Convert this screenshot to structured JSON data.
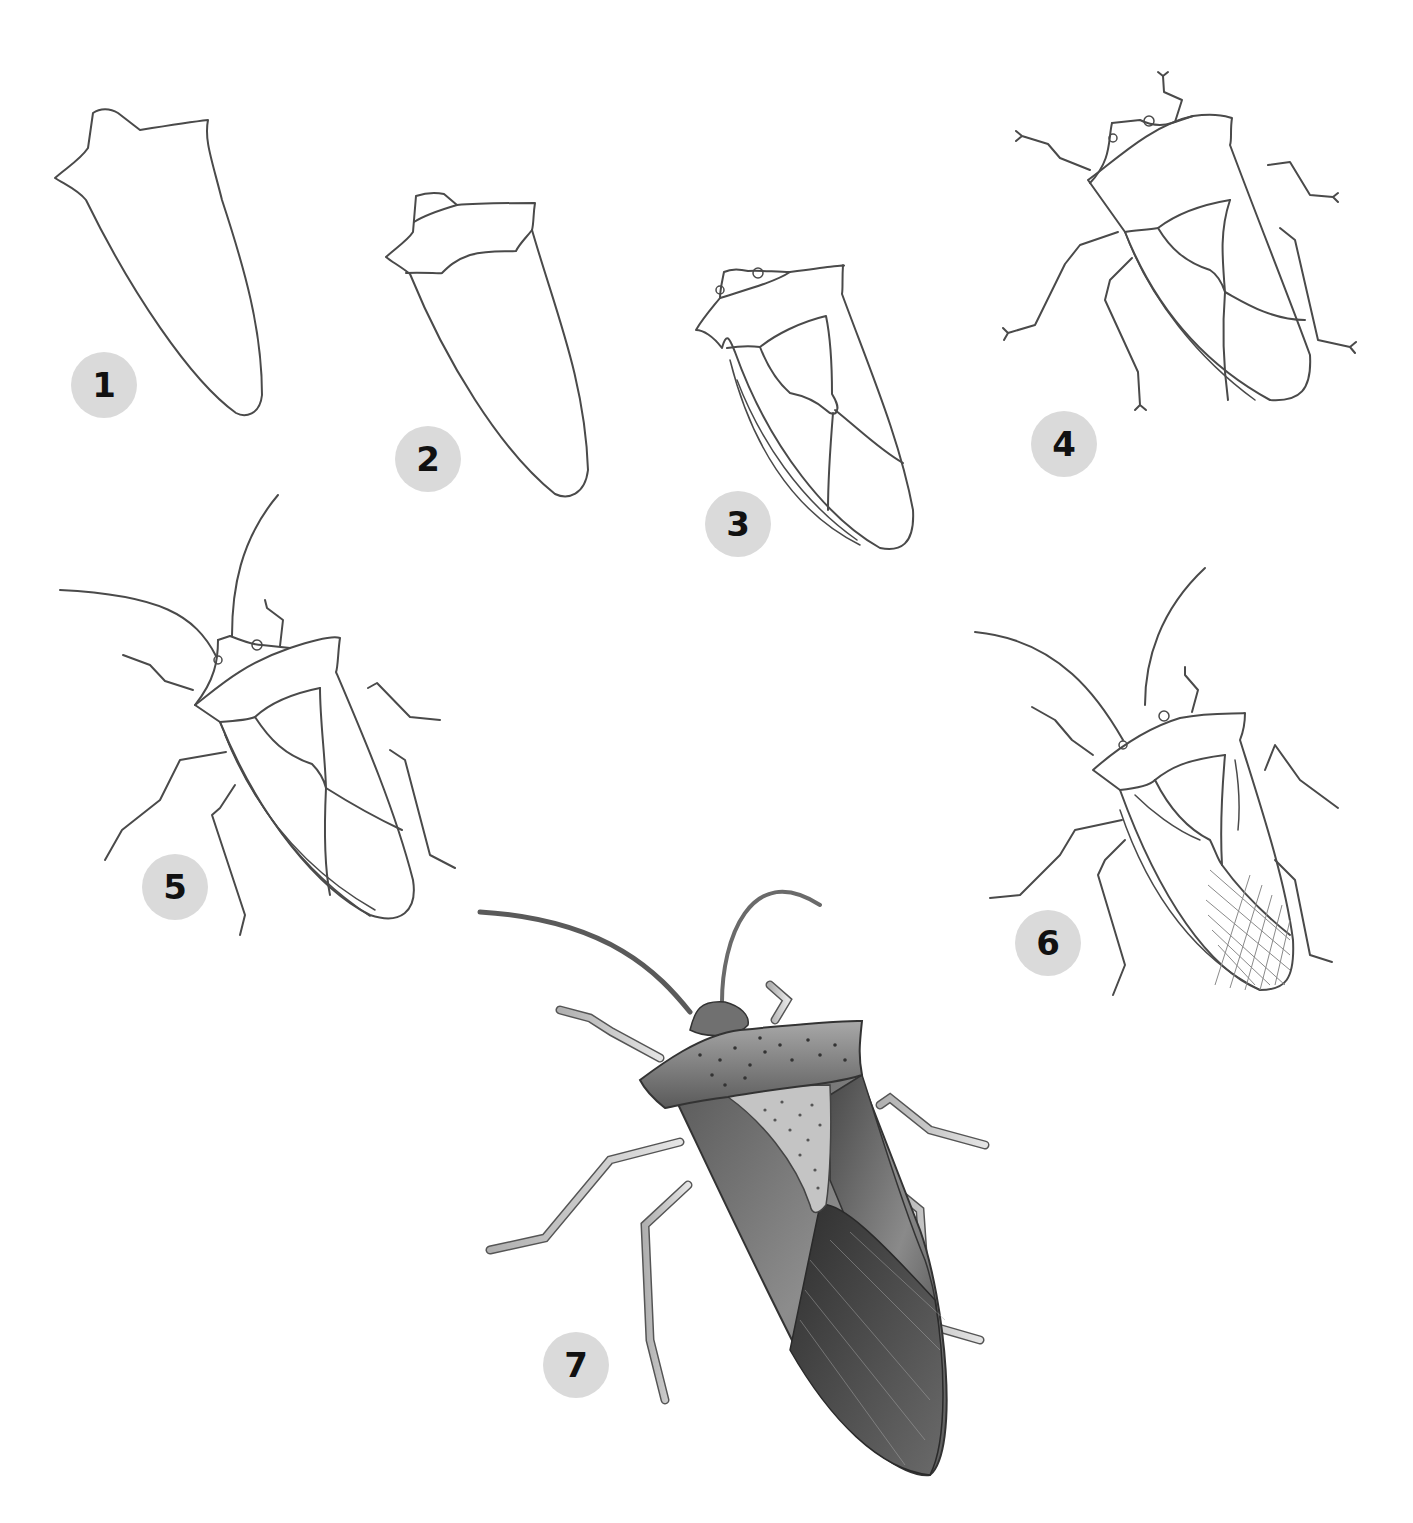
{
  "colors": {
    "background": "#ffffff",
    "line": "#4a4a4a",
    "badge_fill": "#dadada",
    "badge_text": "#111111",
    "shade_dark": "#3c3c3c",
    "shade_mid": "#7a7a7a",
    "shade_light": "#c8c8c8"
  },
  "steps": [
    {
      "number": "1",
      "description": "Outline of body"
    },
    {
      "number": "2",
      "description": "Add pronotum"
    },
    {
      "number": "3",
      "description": "Add head, scutellum and wing lines"
    },
    {
      "number": "4",
      "description": "Add legs"
    },
    {
      "number": "5",
      "description": "Add antennae and segmented edge"
    },
    {
      "number": "6",
      "description": "Add wing texture and hatching"
    },
    {
      "number": "7",
      "description": "Finished shaded drawing"
    }
  ]
}
